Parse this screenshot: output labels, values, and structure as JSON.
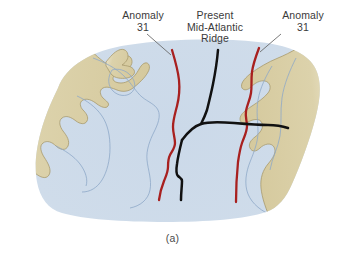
{
  "figure": {
    "panel_caption": "(a)",
    "type": "paleogeographic-map"
  },
  "labels": {
    "anomaly_left": {
      "line1": "Anomaly",
      "line2": "31"
    },
    "ridge": {
      "line1": "Present",
      "line2": "Mid-Atlantic",
      "line3": "Ridge"
    },
    "anomaly_right": {
      "line1": "Anomaly",
      "line2": "31"
    }
  },
  "colors": {
    "land": "#d7cb9f",
    "land_outline": "#a89a6d",
    "ocean": "#ccdaea",
    "ocean_edge": "#e2ebf4",
    "contour": "#8ea8c8",
    "anomaly_line": "#a8201f",
    "ridge_line": "#111111",
    "leader_line": "#6b6b6b",
    "text": "#3a3a3a",
    "background": "#ffffff"
  },
  "features": [
    {
      "name": "north-america-landmass",
      "kind": "land",
      "side": "west"
    },
    {
      "name": "eurasia-africa-landmass",
      "kind": "land",
      "side": "east"
    },
    {
      "name": "atlantic-ocean-basin",
      "kind": "ocean"
    },
    {
      "name": "anomaly-31-west-line",
      "kind": "magnetic-anomaly",
      "label": "Anomaly 31"
    },
    {
      "name": "anomaly-31-east-line",
      "kind": "magnetic-anomaly",
      "label": "Anomaly 31"
    },
    {
      "name": "mid-atlantic-ridge-line",
      "kind": "spreading-ridge",
      "label": "Present Mid-Atlantic Ridge"
    },
    {
      "name": "transform-fault-line",
      "kind": "transform-fault"
    }
  ]
}
